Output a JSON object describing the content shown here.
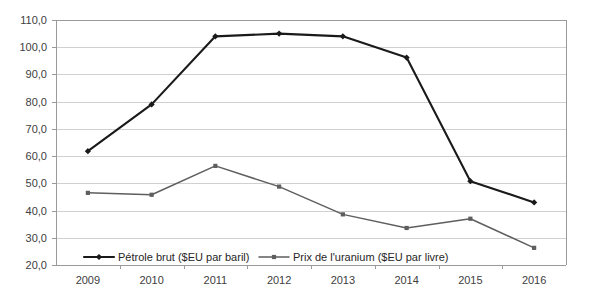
{
  "chart_data": {
    "type": "line",
    "title": "",
    "xlabel": "",
    "ylabel": "",
    "categories": [
      "2009",
      "2010",
      "2011",
      "2012",
      "2013",
      "2014",
      "2015",
      "2016"
    ],
    "x": [
      2009,
      2010,
      2011,
      2012,
      2013,
      2014,
      2015,
      2016
    ],
    "ylim": [
      20.0,
      110.0
    ],
    "ytick_labels": [
      "110,0",
      "100,0",
      "90,0",
      "80,0",
      "70,0",
      "60,0",
      "50,0",
      "40,0",
      "30,0",
      "20,0"
    ],
    "ytick_values": [
      110.0,
      100.0,
      90.0,
      80.0,
      70.0,
      60.0,
      50.0,
      40.0,
      30.0,
      20.0
    ],
    "grid": true,
    "legend_position": "bottom-inside",
    "series": [
      {
        "name": "Pétrole brut ($EU par baril)",
        "marker": "diamond",
        "color": "#1a1a1a",
        "values": [
          61.8,
          79.0,
          104.0,
          105.0,
          104.0,
          96.2,
          50.8,
          43.0
        ]
      },
      {
        "name": "Prix de l'uranium ($EU par livre)",
        "marker": "square",
        "color": "#5e5e5e",
        "values": [
          46.5,
          45.8,
          56.4,
          48.8,
          38.6,
          33.6,
          37.0,
          26.3
        ]
      }
    ]
  },
  "legend": {
    "items": [
      {
        "label": "Pétrole brut ($EU par baril)"
      },
      {
        "label": "Prix de l'uranium ($EU par livre)"
      }
    ]
  }
}
